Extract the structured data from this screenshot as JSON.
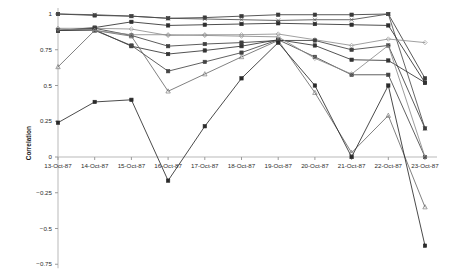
{
  "chart_data": {
    "type": "line",
    "title": "",
    "xlabel": "",
    "ylabel": "Correlation",
    "grid": false,
    "legend": "none",
    "ylim": [
      -0.75,
      1.0
    ],
    "yticks": [
      1,
      0.75,
      0.5,
      0.25,
      0,
      -0.25,
      -0.5,
      -0.75
    ],
    "ytick_labels": [
      "1",
      "0.75",
      "0.5",
      "0.25",
      "0",
      "−0.25",
      "−0.5",
      "−0.75"
    ],
    "categories": [
      "13-Oct-87",
      "14-Oct-87",
      "15-Oct-87",
      "16-Oct-87",
      "17-Oct-87",
      "18-Oct-87",
      "19-Oct-87",
      "20-Oct-87",
      "21-Oct-87",
      "22-Oct-87",
      "23-Oct-87"
    ],
    "x": [
      0,
      1,
      2,
      3,
      4,
      5,
      6,
      7,
      8,
      9,
      10
    ],
    "series": [
      {
        "name": "series-1",
        "color": "#3a3a3a",
        "marker": "square",
        "values": [
          1.0,
          0.99,
          0.985,
          0.97,
          0.975,
          0.985,
          0.995,
          0.995,
          0.995,
          1.0,
          0.55
        ]
      },
      {
        "name": "series-2",
        "color": "#4a4a4a",
        "marker": "x",
        "values": [
          1.0,
          0.995,
          0.985,
          0.97,
          0.965,
          0.96,
          0.955,
          0.96,
          0.96,
          1.0,
          0.2
        ]
      },
      {
        "name": "series-3",
        "color": "#2e2e2e",
        "marker": "square",
        "values": [
          0.885,
          0.905,
          0.945,
          0.92,
          0.925,
          0.93,
          0.935,
          0.93,
          0.925,
          0.92,
          0.52
        ]
      },
      {
        "name": "series-4",
        "color": "#8f8f8f",
        "marker": "diamond",
        "values": [
          0.9,
          0.9,
          0.895,
          0.85,
          0.855,
          0.855,
          0.86,
          0.82,
          0.78,
          0.825,
          0.8
        ]
      },
      {
        "name": "series-5",
        "color": "#3f3f3f",
        "marker": "square",
        "values": [
          0.885,
          0.9,
          0.85,
          0.775,
          0.79,
          0.8,
          0.815,
          0.815,
          0.75,
          0.78,
          0.2
        ]
      },
      {
        "name": "series-6",
        "color": "#333333",
        "marker": "square",
        "values": [
          0.885,
          0.89,
          0.775,
          0.72,
          0.745,
          0.775,
          0.82,
          0.78,
          0.68,
          0.675,
          0.52
        ]
      },
      {
        "name": "series-7",
        "color": "#444444",
        "marker": "square",
        "values": [
          0.885,
          0.885,
          0.78,
          0.6,
          0.665,
          0.73,
          0.82,
          0.7,
          0.575,
          0.575,
          0.0
        ]
      },
      {
        "name": "series-8",
        "color": "#6a6a6a",
        "marker": "triangle",
        "values": [
          0.63,
          0.885,
          0.845,
          0.46,
          0.58,
          0.7,
          0.815,
          0.45,
          0.03,
          0.29,
          -0.35
        ]
      },
      {
        "name": "series-9",
        "color": "#8a8a8a",
        "marker": "diamond",
        "values": [
          0.895,
          0.885,
          0.855,
          0.855,
          0.85,
          0.845,
          0.84,
          0.69,
          0.58,
          0.78,
          0.0
        ]
      },
      {
        "name": "series-10",
        "color": "#2a2a2a",
        "marker": "square",
        "values": [
          0.24,
          0.385,
          0.4,
          -0.165,
          0.215,
          0.55,
          0.8,
          0.5,
          0.0,
          0.5,
          -0.62
        ]
      }
    ]
  }
}
